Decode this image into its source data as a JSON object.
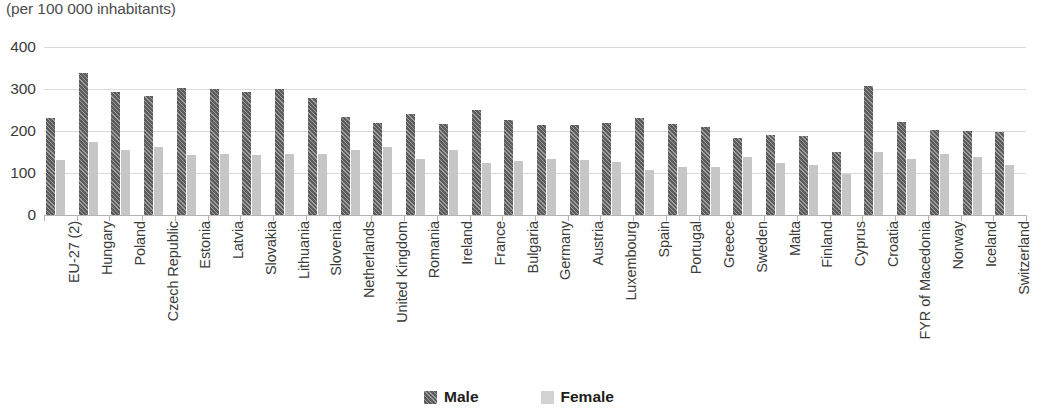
{
  "chart_data": {
    "type": "bar",
    "title": "",
    "subtitle": "(per 100 000 inhabitants)",
    "xlabel": "",
    "ylabel": "",
    "ylim": [
      0,
      400
    ],
    "yticks": [
      0,
      100,
      200,
      300,
      400
    ],
    "grid": true,
    "legend_position": "bottom-center",
    "categories": [
      "EU-27 (2)",
      "Hungary",
      "Poland",
      "Czech Republic",
      "Estonia",
      "Latvia",
      "Slovakia",
      "Lithuania",
      "Slovenia",
      "Netherlands",
      "United Kingdom",
      "Romania",
      "Ireland",
      "France",
      "Bulgaria",
      "Germany",
      "Austria",
      "Luxembourg",
      "Spain",
      "Portugal",
      "Greece",
      "Sweden",
      "Malta",
      "Finland",
      "Cyprus",
      "Croatia",
      "FYR of Macedonia",
      "Norway",
      "Iceland",
      "Switzerland"
    ],
    "series": [
      {
        "name": "Male",
        "color": "#5c5c5c",
        "values": [
          231,
          337,
          292,
          284,
          302,
          300,
          293,
          300,
          278,
          234,
          220,
          241,
          216,
          249,
          226,
          214,
          214,
          219,
          230,
          217,
          210,
          184,
          190,
          188,
          151,
          307,
          222,
          202,
          199,
          197
        ]
      },
      {
        "name": "Female",
        "color": "#c6c6c6",
        "values": [
          132,
          173,
          154,
          163,
          143,
          146,
          142,
          146,
          146,
          154,
          162,
          134,
          155,
          124,
          129,
          134,
          130,
          127,
          107,
          115,
          114,
          137,
          124,
          120,
          97,
          150,
          133,
          145,
          138,
          120
        ]
      }
    ]
  },
  "legend": {
    "items": [
      {
        "label": "Male"
      },
      {
        "label": "Female"
      }
    ]
  }
}
